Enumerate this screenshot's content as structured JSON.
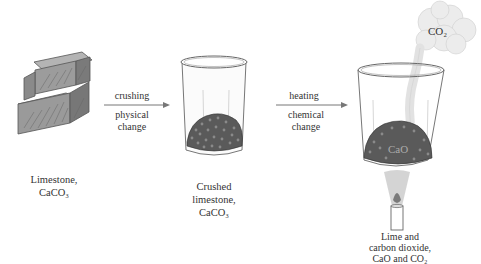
{
  "stages": [
    {
      "id": "limestone",
      "label_lines": [
        "Limestone,",
        "CaCO₃"
      ]
    },
    {
      "id": "crushed-limestone",
      "label_lines": [
        "Crushed",
        "limestone,",
        "CaCO₃"
      ]
    },
    {
      "id": "lime-and-co2",
      "label_lines": [
        "Lime and",
        "carbon dioxide,",
        "CaO and CO₂"
      ],
      "solid_label": "CaO",
      "gas_label": "CO₂"
    }
  ],
  "arrows": [
    {
      "id": "crushing",
      "process": "crushing",
      "change_lines": [
        "physical",
        "change"
      ]
    },
    {
      "id": "heating",
      "process": "heating",
      "change_lines": [
        "chemical",
        "change"
      ]
    }
  ],
  "colors": {
    "rock_fill": "#9a9a9a",
    "rock_dark": "#6e6e6e",
    "rock_light": "#b8b8b8",
    "gravel": "#555555",
    "beaker_line": "#777777",
    "smoke": "#e6e6e6",
    "flame": "#8c8c8c",
    "arrow": "#777777"
  }
}
